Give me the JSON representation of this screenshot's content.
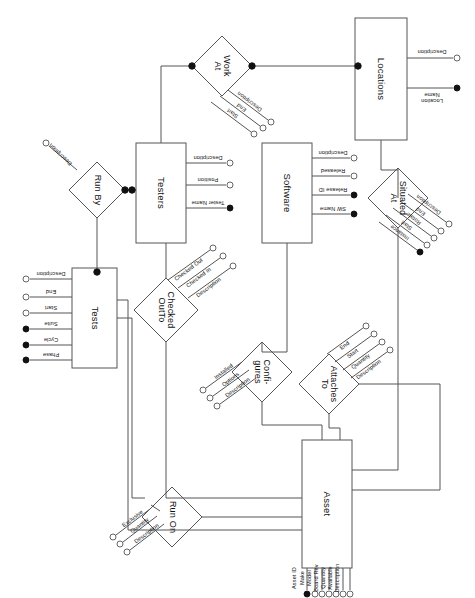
{
  "diagram": {
    "type": "entity-relationship-diagram",
    "orientation": "rotated-90-clockwise",
    "canvas": {
      "width": 475,
      "height": 598
    },
    "stroke_color": "#555555",
    "text_color": "#111111",
    "background": "#ffffff"
  },
  "entities": [
    {
      "id": "locations",
      "name": "Locations",
      "box": {
        "x": 355,
        "y": 18,
        "w": 52,
        "h": 122
      },
      "attributes": [
        {
          "label": "Description",
          "key": false
        },
        {
          "label": "Location\nName",
          "key": true
        }
      ]
    },
    {
      "id": "testers",
      "name": "Testers",
      "box": {
        "x": 136,
        "y": 143,
        "w": 50,
        "h": 100
      },
      "attributes": [
        {
          "label": "Description",
          "key": false
        },
        {
          "label": "Position",
          "key": false
        },
        {
          "label": "Tester Name",
          "key": true
        }
      ]
    },
    {
      "id": "software",
      "name": "Software",
      "box": {
        "x": 262,
        "y": 143,
        "w": 50,
        "h": 100
      },
      "attributes": [
        {
          "label": "Description",
          "key": false
        },
        {
          "label": "Released",
          "key": false
        },
        {
          "label": "Release ID",
          "key": true
        },
        {
          "label": "SW Name",
          "key": true
        }
      ]
    },
    {
      "id": "tests",
      "name": "Tests",
      "box": {
        "x": 72,
        "y": 268,
        "w": 45,
        "h": 100
      },
      "attributes": [
        {
          "label": "Description",
          "key": false
        },
        {
          "label": "End",
          "key": false
        },
        {
          "label": "Start",
          "key": false
        },
        {
          "label": "Suite",
          "key": true
        },
        {
          "label": "Cycle",
          "key": true
        },
        {
          "label": "Phase",
          "key": true
        }
      ]
    },
    {
      "id": "asset",
      "name": "Asset",
      "box": {
        "x": 302,
        "y": 440,
        "w": 50,
        "h": 128
      },
      "attributes": [
        {
          "label": "Asset ID",
          "key": true
        },
        {
          "label": "Make",
          "key": false
        },
        {
          "label": "Model",
          "key": false
        },
        {
          "label": "Board Rev",
          "key": false
        },
        {
          "label": "Quantity",
          "key": false
        },
        {
          "label": "Available",
          "key": false
        },
        {
          "label": "Description",
          "key": false
        }
      ]
    }
  ],
  "relationships": [
    {
      "id": "work-at",
      "name": "Work\nAt",
      "center": {
        "x": 222,
        "y": 66
      },
      "half": 30,
      "attributes": [
        {
          "label": "Description",
          "key": false
        },
        {
          "label": "End",
          "key": false
        },
        {
          "label": "Start",
          "key": false
        }
      ]
    },
    {
      "id": "situated-at",
      "name": "Situated\nAt",
      "center": {
        "x": 398,
        "y": 198
      },
      "half": 30,
      "attributes": [
        {
          "label": "Description",
          "key": false
        },
        {
          "label": "End",
          "key": false
        },
        {
          "label": "Rotate",
          "key": false
        },
        {
          "label": "Start",
          "key": false
        },
        {
          "label": "Instance",
          "key": true
        }
      ]
    },
    {
      "id": "run-by",
      "name": "Run By",
      "center": {
        "x": 97,
        "y": 190
      },
      "half": 28,
      "attributes": [
        {
          "label": "Description",
          "key": false
        }
      ]
    },
    {
      "id": "checked-out-to",
      "name": "Checked\nOutTo",
      "center": {
        "x": 166,
        "y": 310
      },
      "half": 32,
      "attributes": [
        {
          "label": "Checked Out",
          "key": false
        },
        {
          "label": "Checked In",
          "key": false
        },
        {
          "label": "Description",
          "key": false
        }
      ]
    },
    {
      "id": "configures",
      "name": "Confi-\ngures",
      "center": {
        "x": 262,
        "y": 372
      },
      "half": 30,
      "attributes": [
        {
          "label": "Installed",
          "key": false
        },
        {
          "label": "Options",
          "key": false
        },
        {
          "label": "Description",
          "key": false
        }
      ]
    },
    {
      "id": "attaches-to",
      "name": "Attaches\nTo",
      "center": {
        "x": 329,
        "y": 384
      },
      "half": 30,
      "attributes": [
        {
          "label": "End",
          "key": false
        },
        {
          "label": "Start",
          "key": false
        },
        {
          "label": "Quantity",
          "key": false
        },
        {
          "label": "Description",
          "key": false
        }
      ]
    },
    {
      "id": "run-on",
      "name": "Run On",
      "center": {
        "x": 172,
        "y": 517
      },
      "half": 30,
      "attributes": [
        {
          "label": "Exclusive",
          "key": false
        },
        {
          "label": "Quantity",
          "key": false
        },
        {
          "label": "Description",
          "key": false
        }
      ]
    }
  ],
  "connections": [
    {
      "from": "testers",
      "to": "work-at",
      "participation": "total"
    },
    {
      "from": "work-at",
      "to": "locations",
      "participation": "total"
    },
    {
      "from": "locations",
      "to": "situated-at",
      "participation": "partial"
    },
    {
      "from": "situated-at",
      "to": "asset",
      "participation": "partial"
    },
    {
      "from": "testers",
      "to": "run-by",
      "participation": "total"
    },
    {
      "from": "run-by",
      "to": "tests",
      "participation": "total"
    },
    {
      "from": "testers",
      "to": "checked-out-to",
      "participation": "partial"
    },
    {
      "from": "checked-out-to",
      "to": "asset",
      "participation": "partial"
    },
    {
      "from": "software",
      "to": "configures",
      "participation": "partial"
    },
    {
      "from": "configures",
      "to": "asset",
      "participation": "partial"
    },
    {
      "from": "asset",
      "to": "attaches-to",
      "participation": "partial"
    },
    {
      "from": "tests",
      "to": "run-on",
      "participation": "partial"
    },
    {
      "from": "run-on",
      "to": "asset",
      "participation": "partial"
    }
  ]
}
